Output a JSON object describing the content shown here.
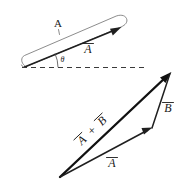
{
  "figure": {
    "background_color": "#ffffff",
    "ink_color": "#111111",
    "light_ink_color": "#6e6e6e",
    "width": 185,
    "height": 184
  },
  "top_panel": {
    "name": "vector-a-with-angle",
    "magnitude_label": "A",
    "vector_label": "A",
    "angle_label": "θ",
    "baseline_style": "dashed",
    "loop_annotation": "elongated-loop-brace"
  },
  "bottom_panel": {
    "name": "vector-addition-triangle",
    "resultant_label": "A + B",
    "resultant_label_parts": {
      "first": "A",
      "operator": "+",
      "second": "B"
    },
    "vector_b_label": "B",
    "vector_a_label": "A"
  },
  "annotations": {
    "overbar_glyph": "→",
    "plus_glyph": "+"
  }
}
